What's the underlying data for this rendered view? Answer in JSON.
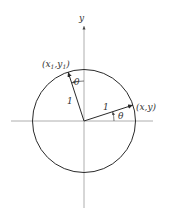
{
  "diagram": {
    "axes": {
      "y_label": "y"
    },
    "circle": {
      "radius_label": "1"
    },
    "vectors": [
      {
        "name": "original",
        "angle_deg": 18,
        "length_label": "1",
        "point_label": "(x,y)"
      },
      {
        "name": "rotated",
        "angle_deg": 108,
        "length_label": "1",
        "point_label_main": "(x",
        "point_label_sub1": "1",
        "point_label_mid": ",y",
        "point_label_sub2": "1",
        "point_label_end": ")"
      }
    ],
    "angles": [
      {
        "name": "theta-from-x-axis",
        "label": "θ"
      },
      {
        "name": "theta-from-y-axis",
        "label": "θ"
      }
    ]
  }
}
